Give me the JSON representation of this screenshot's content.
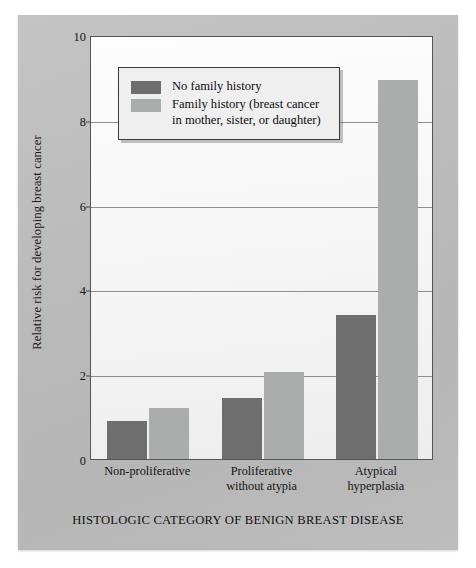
{
  "chart_data": {
    "type": "bar",
    "title": "",
    "xlabel": "HISTOLOGIC CATEGORY OF BENIGN BREAST DISEASE",
    "ylabel": "Relative risk for developing breast cancer",
    "ylim": [
      0,
      10
    ],
    "yticks": [
      0,
      2,
      4,
      6,
      8,
      10
    ],
    "grid": "horizontal",
    "legend_position": "upper-left-inside",
    "categories": [
      "Non-proliferative",
      "Proliferative\nwithout atypia",
      "Atypical\nhyperplasia"
    ],
    "category_lines": [
      [
        "Non-proliferative"
      ],
      [
        "Proliferative",
        "without atypia"
      ],
      [
        "Atypical",
        "hyperplasia"
      ]
    ],
    "series": [
      {
        "name": "No family history",
        "color": "#6e6e6e",
        "values": [
          0.9,
          1.45,
          3.4
        ]
      },
      {
        "name": "Family history (breast cancer in mother, sister, or daughter)",
        "color": "#abacac",
        "values": [
          1.2,
          2.05,
          8.95
        ]
      }
    ]
  },
  "legend": {
    "entries": [
      {
        "swatch": "dark-swatch",
        "line1": "No family history",
        "line2": ""
      },
      {
        "swatch": "light-swatch",
        "line1": "Family history (breast cancer",
        "line2": "in mother, sister, or daughter)"
      }
    ]
  },
  "axis": {
    "y_title": "Relative risk for developing breast cancer",
    "x_title": "HISTOLOGIC CATEGORY OF BENIGN BREAST DISEASE",
    "tick_0": "0",
    "tick_2": "2",
    "tick_4": "4",
    "tick_6": "6",
    "tick_8": "8",
    "tick_10": "10"
  },
  "colors": {
    "panel": "#bdbdbd",
    "plot_background": "#f6f6f6",
    "bar_dark": "#6e6e6e",
    "bar_light": "#abacac",
    "axis_line": "#555555",
    "gridline": "#7d7d7d"
  }
}
